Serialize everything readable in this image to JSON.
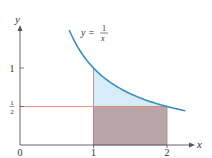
{
  "chart_data": {
    "type": "area",
    "title": "",
    "xlabel": "x",
    "ylabel": "y",
    "xlim": [
      0,
      2.4
    ],
    "ylim": [
      0,
      1.5
    ],
    "grid": false,
    "curve": {
      "label_lhs": "y =",
      "label_num": "1",
      "label_den": "x",
      "function": "1/x",
      "x_start": 0.67,
      "x_end": 2.25,
      "color": "#3b8fc0"
    },
    "shaded_region_under_curve": {
      "x_from": 1,
      "x_to": 2,
      "y_lower": 0.5,
      "fill": "#d6ecf7"
    },
    "rectangle": {
      "x_from": 1,
      "x_to": 2,
      "y_from": 0,
      "y_to": 0.5,
      "fill": "#b8a6a9",
      "edge": "#b07f80"
    },
    "horizontal_line": {
      "y": 0.5,
      "x_from": 0,
      "x_to": 2,
      "color": "#e88a6f"
    },
    "x_ticks": [
      {
        "value": 0,
        "label": "0"
      },
      {
        "value": 1,
        "label": "1"
      },
      {
        "value": 2,
        "label": "2"
      }
    ],
    "y_ticks": [
      {
        "value": 1,
        "label": "1"
      },
      {
        "value": 0.5,
        "label_num": "1",
        "label_den": "2"
      }
    ],
    "axis_color": "#555555"
  }
}
